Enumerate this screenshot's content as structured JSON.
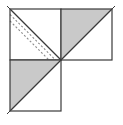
{
  "figure": {
    "canvas": {
      "width": 123,
      "height": 125,
      "background": "#ffffff"
    },
    "colors": {
      "fill_white": "#ffffff",
      "fill_gray": "#c9c9c9",
      "stroke_outline": "#3a3a3a",
      "stroke_diagonal": "#3a3a3a",
      "stroke_dashed": "#8a8a8a"
    },
    "geometry": {
      "cell_size": 51,
      "origin_x": 10,
      "origin_y": 9,
      "mid_x": 61,
      "mid_y": 60,
      "end_x": 112,
      "end_y": 111,
      "outline_width": 1.2,
      "diagonal_width": 1.2,
      "dash_pattern": "2 2"
    },
    "cells": [
      {
        "id": "cell-top-left",
        "label": "top-left-square",
        "row": 0,
        "col": 0,
        "x": 10,
        "y": 9,
        "size": 51,
        "upper_left_fill": "#ffffff",
        "lower_right_fill": "#ffffff",
        "diagonal": "tl-br",
        "dashed_lines": 2
      },
      {
        "id": "cell-top-right",
        "label": "top-right-square",
        "row": 0,
        "col": 1,
        "x": 61,
        "y": 9,
        "size": 51,
        "upper_left_fill": "#c9c9c9",
        "lower_right_fill": "#ffffff",
        "diagonal": "bl-tr",
        "dashed_lines": 0
      },
      {
        "id": "cell-bottom-left",
        "label": "bottom-left-square",
        "row": 1,
        "col": 0,
        "x": 10,
        "y": 60,
        "size": 51,
        "upper_left_fill": "#c9c9c9",
        "lower_right_fill": "#ffffff",
        "diagonal": "bl-tr",
        "dashed_lines": 0
      }
    ],
    "empty_cell": {
      "id": "cell-bottom-right",
      "label": "bottom-right-empty",
      "row": 1,
      "col": 1,
      "x": 61,
      "y": 60,
      "size": 51
    }
  }
}
